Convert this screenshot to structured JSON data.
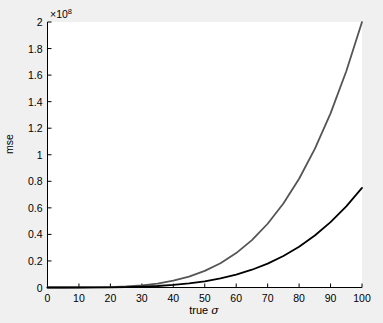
{
  "chart_data": {
    "type": "line",
    "title": "",
    "xlabel": "true σ",
    "ylabel": "mse",
    "y_multiplier_label": "×10",
    "y_multiplier_exponent": "8",
    "y_scale": 100000000,
    "xlim": [
      0,
      100
    ],
    "ylim": [
      0,
      2
    ],
    "grid": false,
    "legend": "none",
    "box": "off",
    "xticks": [
      0,
      10,
      20,
      30,
      40,
      50,
      60,
      70,
      80,
      90,
      100
    ],
    "xticklabels": [
      "0",
      "10",
      "20",
      "30",
      "40",
      "50",
      "60",
      "70",
      "80",
      "90",
      "100"
    ],
    "yticks": [
      0,
      0.2,
      0.4,
      0.6,
      0.8,
      1,
      1.2,
      1.4,
      1.6,
      1.8,
      2
    ],
    "yticklabels": [
      "0",
      "0.2",
      "0.4",
      "0.6",
      "0.8",
      "1",
      "1.2",
      "1.4",
      "1.6",
      "1.8",
      "2"
    ],
    "x": [
      0,
      5,
      10,
      15,
      20,
      25,
      30,
      35,
      40,
      45,
      50,
      55,
      60,
      65,
      70,
      75,
      80,
      85,
      90,
      95,
      100
    ],
    "series": [
      {
        "name": "upper-curve",
        "color": "#555555",
        "width": 1.8,
        "values": [
          0.0,
          0.0001,
          0.002,
          0.0101,
          0.032,
          0.0781,
          0.162,
          0.3001,
          0.512,
          0.8201,
          1.25,
          1.8301,
          2.592,
          3.5701,
          4.802,
          6.3281,
          8.192,
          10.4401,
          13.122,
          16.2901,
          20.0
        ]
      },
      {
        "name": "lower-curve",
        "color": "#000000",
        "width": 1.8,
        "values": [
          0.0,
          0.0,
          0.0008,
          0.0038,
          0.012,
          0.0293,
          0.0608,
          0.1125,
          0.192,
          0.3075,
          0.4688,
          0.6863,
          0.972,
          1.3388,
          1.8008,
          2.373,
          3.072,
          3.915,
          4.9208,
          6.1088,
          7.5
        ]
      }
    ],
    "series_note_scale": "values are in units of 1e7 of the plotted axis (divide by 10 for axis units)"
  },
  "colors": {
    "figure_background": "#f0f0f0",
    "plot_background": "#ffffff",
    "axis": "#000000",
    "upper_curve": "#555555",
    "lower_curve": "#000000"
  }
}
